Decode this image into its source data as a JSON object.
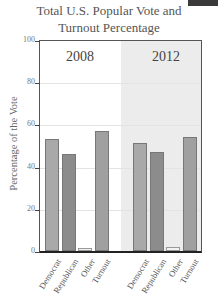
{
  "chart_data": {
    "type": "bar",
    "title": "Total U.S. Popular Vote and Turnout Percentage",
    "title_lines": [
      "Total U.S. Popular Vote and",
      "Turnout Percentage"
    ],
    "xlabel": "",
    "ylabel": "Percentage of the Vote",
    "ylim": [
      0,
      100
    ],
    "yticks": [
      0,
      20,
      40,
      60,
      80,
      100
    ],
    "grid": true,
    "legend": null,
    "categories": [
      "Democrat",
      "Republican",
      "Other",
      "Turnout"
    ],
    "series": [
      {
        "name": "2008",
        "values": [
          53,
          46,
          1.5,
          57
        ]
      },
      {
        "name": "2012",
        "values": [
          51,
          47,
          2,
          54
        ]
      }
    ],
    "colors": {
      "Democrat": "#a9a9a9",
      "Republican": "#8c8c8c",
      "Other": "#f2f2f2",
      "Turnout": "#a0a0a0",
      "panel_2012_bg": "#ececec"
    }
  },
  "labels": {
    "title_line1": "Total U.S. Popular Vote and",
    "title_line2": "Turnout Percentage",
    "ylabel": "Percentage of the Vote",
    "year_2008": "2008",
    "year_2012": "2012",
    "ticks": [
      "0",
      "20",
      "40",
      "60",
      "80",
      "100"
    ],
    "cats": [
      "Democrat",
      "Republican",
      "Other",
      "Turnout"
    ]
  }
}
